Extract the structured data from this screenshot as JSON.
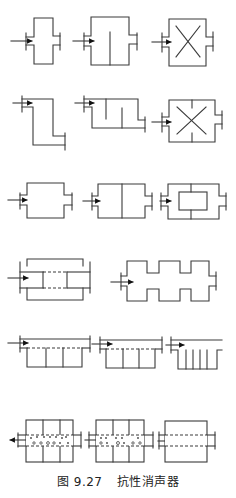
{
  "figure": {
    "number_label": "图 9.27",
    "title": "抗性消声器",
    "line_color": "#3a3a3a",
    "background": "#ffffff"
  },
  "rows": [
    {
      "row": 1,
      "variants": [
        "single expansion chamber",
        "expansion chamber with center baffle",
        "expansion chamber with crossed inserts"
      ]
    },
    {
      "row": 2,
      "variants": [
        "offset (Z-shaped) expansion chamber",
        "expansion chamber with staggered baffles",
        "expansion chamber with crossed inserts and baffles"
      ]
    },
    {
      "row": 3,
      "variants": [
        "expansion chamber",
        "two-chamber expansion",
        "chamber with inner box"
      ]
    },
    {
      "row": 4,
      "variants": [
        "expansion chamber with perforated inner tube",
        "multi-stage (three-cell) expansion chamber"
      ]
    },
    {
      "row": 5,
      "variants": [
        "side-branch resonator (3 cells)",
        "side-branch resonator (3 cells)",
        "comb-type side-branch resonator"
      ]
    },
    {
      "row": 6,
      "variants": [
        "perforated tube resonator (reverse flow)",
        "perforated tube resonator",
        "perforated tube through chamber"
      ]
    }
  ]
}
